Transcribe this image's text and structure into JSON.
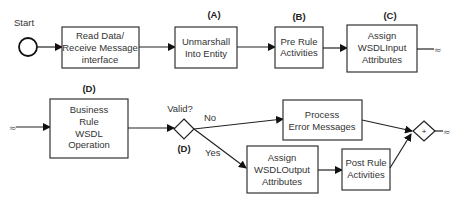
{
  "diagram": {
    "start_label": "Start",
    "squiggle": "≈",
    "row1": {
      "read_box": {
        "lines": [
          "Read Data/",
          "Receive Message",
          "interface"
        ]
      },
      "unmarshall_box": {
        "tag": "(A)",
        "lines": [
          "Unmarshall",
          "Into Entity"
        ]
      },
      "pre_rule_box": {
        "tag": "(B)",
        "lines": [
          "Pre Rule",
          "Activities"
        ]
      },
      "assign_input_box": {
        "tag": "(C)",
        "lines": [
          "Assign",
          "WSDLInput",
          "Attributes"
        ]
      }
    },
    "row2": {
      "business_rule_box": {
        "tag": "(D)",
        "lines": [
          "Business",
          "Rule",
          "WSDL",
          "Operation"
        ]
      },
      "decision": {
        "question": "Valid?",
        "tag": "(D)",
        "no_label": "No",
        "yes_label": "Yes"
      },
      "process_error_box": {
        "lines": [
          "Process",
          "Error Messages"
        ]
      },
      "assign_output_box": {
        "lines": [
          "Assign",
          "WSDLOutput",
          "Attributes"
        ]
      },
      "post_rule_box": {
        "lines": [
          "Post Rule",
          "Activities"
        ]
      },
      "merge_gateway": {
        "symbol": "+"
      }
    }
  }
}
